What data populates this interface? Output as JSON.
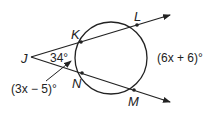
{
  "diagram": {
    "type": "circle with two secants from external point",
    "points": {
      "J": {
        "label": "J",
        "x": 31,
        "y": 57
      },
      "K": {
        "label": "K",
        "x": 81,
        "y": 42
      },
      "L": {
        "label": "L",
        "x": 137,
        "y": 25
      },
      "N": {
        "label": "N",
        "x": 82,
        "y": 73
      },
      "M": {
        "label": "M",
        "x": 134,
        "y": 90
      }
    },
    "circle": {
      "cx": 111,
      "cy": 58,
      "r": 36
    },
    "angle_label": "34°",
    "near_arc_label": "(3x − 5)°",
    "far_arc_label": "(6x + 6)°",
    "colors": {
      "stroke": "#222222",
      "background": "#ffffff"
    }
  }
}
